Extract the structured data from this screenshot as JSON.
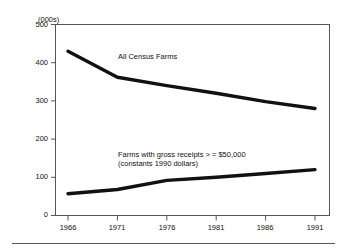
{
  "figure": {
    "unit_label": "(000s)",
    "top_faint_text": "",
    "background_color": "#ffffff",
    "line_color": "#111111",
    "axis_color": "#555555"
  },
  "chart_data": {
    "type": "line",
    "title": "",
    "subtitle": "",
    "xlabel": "",
    "ylabel": "(000s)",
    "x": [
      1966,
      1971,
      1976,
      1981,
      1986,
      1991
    ],
    "xtick_labels": [
      "1966",
      "1971",
      "1976",
      "1981",
      "1986",
      "1991"
    ],
    "ytick_labels": [
      "0",
      "100",
      "200",
      "300",
      "400",
      "500"
    ],
    "yticks": [
      0,
      100,
      200,
      300,
      400,
      500
    ],
    "ylim": [
      0,
      500
    ],
    "xlim": [
      1966,
      1991
    ],
    "grid": false,
    "legend_position": "inline-annotation",
    "series": [
      {
        "name": "All Census Farms",
        "values": [
          430,
          362,
          340,
          320,
          298,
          280
        ]
      },
      {
        "name": "Farms with gross receipts > = $50,000 (constants 1990 dollars)",
        "values": [
          57,
          68,
          92,
          100,
          110,
          120
        ]
      }
    ],
    "annotations": [
      {
        "text": "All Census Farms",
        "x": 1972.2,
        "y": 408
      },
      {
        "text": "Farms with gross receipts > = $50,000",
        "x": 1972.0,
        "y": 170
      },
      {
        "text": "(constants 1990 dollars)",
        "x": 1972.0,
        "y": 151
      }
    ]
  },
  "axis": {
    "y_labels": [
      "500",
      "400",
      "300",
      "200",
      "100",
      "0"
    ],
    "x_labels": [
      "1966",
      "1971",
      "1976",
      "1981",
      "1986",
      "1991"
    ]
  },
  "labels": {
    "upper_series": "All Census Farms",
    "lower_series_line1": "Farms with gross receipts > = $50,000",
    "lower_series_line2": "(constants 1990 dollars)"
  }
}
